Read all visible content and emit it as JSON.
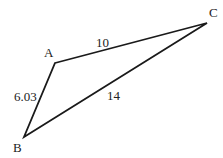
{
  "diagram": {
    "type": "triangle",
    "vertices": [
      {
        "id": "A",
        "label": "A",
        "x": 55,
        "y": 63,
        "label_x": 44,
        "label_y": 57
      },
      {
        "id": "B",
        "label": "B",
        "x": 24,
        "y": 137,
        "label_x": 13,
        "label_y": 152
      },
      {
        "id": "C",
        "label": "C",
        "x": 207,
        "y": 23,
        "label_x": 209,
        "label_y": 17
      }
    ],
    "edges": [
      {
        "from": "A",
        "to": "C",
        "length_label": "10",
        "label_x": 96,
        "label_y": 47
      },
      {
        "from": "B",
        "to": "C",
        "length_label": "14",
        "label_x": 107,
        "label_y": 100
      },
      {
        "from": "A",
        "to": "B",
        "length_label": "6.03",
        "label_x": 14,
        "label_y": 101
      }
    ],
    "colors": {
      "stroke": "#1a1a1a",
      "text": "#222222",
      "background": "#ffffff"
    }
  }
}
